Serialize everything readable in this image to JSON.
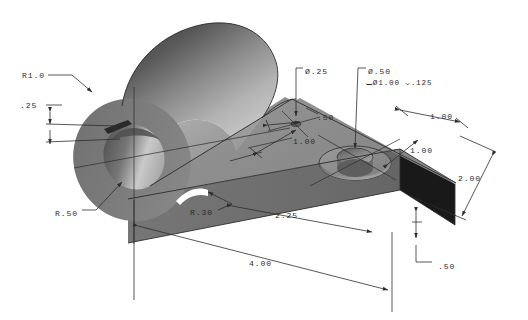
{
  "drawing": {
    "title": "Isometric pictorial of bracket / clevis plate",
    "projection": "isometric",
    "units": "inch",
    "background_color": "#ffffff",
    "line_color": "#2d2d2d",
    "shading": {
      "boss_top_dark": "#4a4a4a",
      "boss_light": "#c6c6c6",
      "plate_top": "#8d8d8d",
      "plate_front": "#6e6e6e",
      "plate_side_dark": "#1c1c1c",
      "bore_inner_dark": "#5a5a5a",
      "bore_inner_light": "#d2d2d2"
    }
  },
  "annotations": [
    {
      "id": "r1-0",
      "label": "R1.0",
      "type": "radius-leader",
      "x": 22,
      "y": 75
    },
    {
      "id": "v-025",
      "label": ".25",
      "type": "linear-dimension",
      "x": 20,
      "y": 105
    },
    {
      "id": "r-50",
      "label": "R.50",
      "type": "radius-leader",
      "x": 55,
      "y": 213
    },
    {
      "id": "r-30",
      "label": "R.30",
      "type": "radius-leader",
      "x": 190,
      "y": 212
    },
    {
      "id": "dia-25",
      "label": "Ø.25",
      "type": "hole-callout",
      "x": 305,
      "y": 71
    },
    {
      "id": "dia-50",
      "label": "Ø.50",
      "type": "hole-callout",
      "x": 368,
      "y": 71
    },
    {
      "id": "cbore-note",
      "label": "⌴Ø1.00 ⌵.125",
      "type": "counterbore-note",
      "x": 366,
      "y": 82
    },
    {
      "id": "h-50",
      "label": ".50",
      "type": "linear-dimension",
      "x": 317,
      "y": 117
    },
    {
      "id": "h-100-left",
      "label": "1.00",
      "type": "linear-dimension",
      "x": 293,
      "y": 141
    },
    {
      "id": "h-100-top",
      "label": "1.00",
      "type": "linear-dimension",
      "x": 430,
      "y": 116
    },
    {
      "id": "h-100-right",
      "label": "1.00",
      "type": "linear-dimension",
      "x": 410,
      "y": 150
    },
    {
      "id": "w-200",
      "label": "2.00",
      "type": "linear-dimension",
      "x": 458,
      "y": 178
    },
    {
      "id": "l-225",
      "label": "2.25",
      "type": "linear-dimension",
      "x": 275,
      "y": 215
    },
    {
      "id": "t-50",
      "label": ".50",
      "type": "linear-dimension",
      "x": 438,
      "y": 266
    },
    {
      "id": "l-400",
      "label": "4.00",
      "type": "linear-dimension",
      "x": 249,
      "y": 263
    }
  ],
  "features": [
    {
      "name": "cylindrical-boss",
      "description": "large cylinder boss at left end"
    },
    {
      "name": "through-bore",
      "description": "R.50 bore through boss with keyway slot"
    },
    {
      "name": "keyway-slot",
      "description": "small rectangular keyway in bore wall"
    },
    {
      "name": "small-hole",
      "description": "Ø.25 through hole in plate"
    },
    {
      "name": "counterbored-hole",
      "description": "Ø.50 hole with Ø1.00 counterbore .125 deep"
    },
    {
      "name": "rectangular-plate",
      "description": "2.00 x 2.25 x .50 plate"
    },
    {
      "name": "fillet-r30",
      "description": "R.30 fillet where boss meets plate"
    }
  ]
}
